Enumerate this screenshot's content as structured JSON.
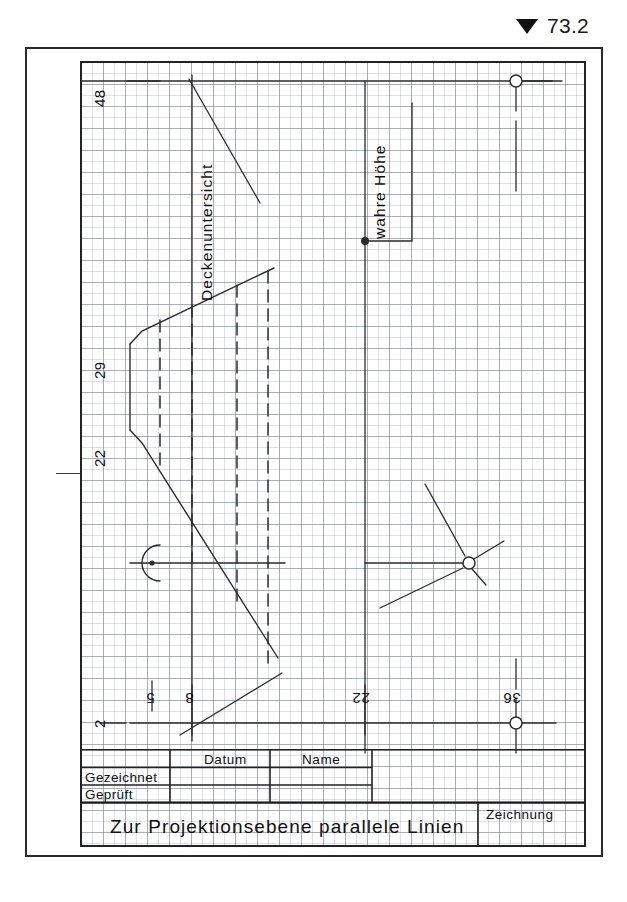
{
  "top_marker": {
    "icon": "triangle-down-icon",
    "value": "73.2"
  },
  "drawing": {
    "annotations": [
      {
        "id": "deckenuntersicht",
        "text": "Deckenuntersicht"
      },
      {
        "id": "wahre-hoehe",
        "text": "wahre Höhe"
      }
    ],
    "axis_labels": [
      {
        "id": "label-48",
        "text": "48",
        "side": "left"
      },
      {
        "id": "label-29",
        "text": "29",
        "side": "left"
      },
      {
        "id": "label-22-left",
        "text": "22",
        "side": "left"
      },
      {
        "id": "label-2",
        "text": "2",
        "side": "bottom-left"
      },
      {
        "id": "label-5",
        "text": "5",
        "side": "bottom"
      },
      {
        "id": "label-8",
        "text": "8",
        "side": "bottom"
      },
      {
        "id": "label-22-bottom",
        "text": "22",
        "side": "bottom"
      },
      {
        "id": "label-36",
        "text": "36",
        "side": "bottom-right"
      }
    ],
    "colors": {
      "line": "#2b2b2b",
      "frame": "#222222",
      "grid_fine": "#969baf",
      "grid_coarse": "#787d96",
      "paper": "#ffffff"
    }
  },
  "title_block": {
    "column_headers": [
      "",
      "Datum",
      "Name"
    ],
    "rows": [
      {
        "label": "Gezeichnet",
        "datum": "",
        "name": ""
      },
      {
        "label": "Geprüft",
        "datum": "",
        "name": ""
      }
    ],
    "drawing_title": "Zur Projektionsebene  parallele  Linien",
    "sheet_label": "Zeichnung",
    "sheet_value": ""
  }
}
